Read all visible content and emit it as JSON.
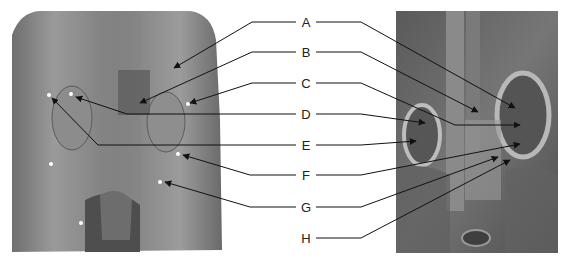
{
  "figure": {
    "left_panel": {
      "description": "Dissection photograph, posterior abdominal wall with kidneys",
      "tone": "#8a8a8a"
    },
    "right_panel": {
      "description": "Anatomical illustration, retroperitoneum with kidneys",
      "tone": "#6e6e6e"
    },
    "labels": [
      {
        "letter": "A",
        "y": 22
      },
      {
        "letter": "B",
        "y": 52
      },
      {
        "letter": "C",
        "y": 83
      },
      {
        "letter": "D",
        "y": 114
      },
      {
        "letter": "E",
        "y": 145
      },
      {
        "letter": "F",
        "y": 175
      },
      {
        "letter": "G",
        "y": 207
      },
      {
        "letter": "H",
        "y": 238
      }
    ]
  }
}
